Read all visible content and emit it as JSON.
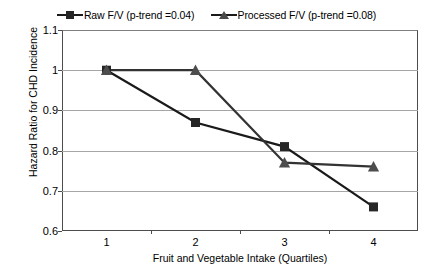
{
  "chart_data": {
    "type": "line",
    "title": "",
    "xlabel": "Fruit and Vegetable Intake (Quartiles)",
    "ylabel": "Hazard Ratio for CHD Incidence",
    "categories": [
      "1",
      "2",
      "3",
      "4"
    ],
    "x": [
      1,
      2,
      3,
      4
    ],
    "ylim": [
      0.6,
      1.1
    ],
    "yticks": [
      0.6,
      0.7,
      0.8,
      0.9,
      1.0,
      1.1
    ],
    "ytick_labels": [
      "0.6",
      "0.7",
      "0.8",
      "0.9",
      "1",
      "1.1"
    ],
    "grid": true,
    "legend_position": "top-center",
    "series": [
      {
        "name": "Raw F/V (p-trend =0.04)",
        "marker": "square",
        "color": "#262626",
        "values": [
          1.0,
          0.87,
          0.81,
          0.66
        ]
      },
      {
        "name": "Processed F/V (p-trend =0.08)",
        "marker": "triangle",
        "color": "#4d4d4d",
        "values": [
          1.0,
          1.0,
          0.77,
          0.76
        ]
      }
    ]
  },
  "legend": {
    "entries": [
      {
        "label": "Raw F/V (p-trend =0.04)",
        "marker": "square-marker-icon"
      },
      {
        "label": "Processed F/V (p-trend =0.08)",
        "marker": "triangle-marker-icon"
      }
    ]
  },
  "axes": {
    "y_title": "Hazard Ratio for CHD Incidence",
    "x_title": "Fruit and Vegetable Intake (Quartiles)",
    "y_labels": [
      "1.1",
      "1",
      "0.9",
      "0.8",
      "0.7",
      "0.6"
    ],
    "x_labels": [
      "1",
      "2",
      "3",
      "4"
    ]
  }
}
